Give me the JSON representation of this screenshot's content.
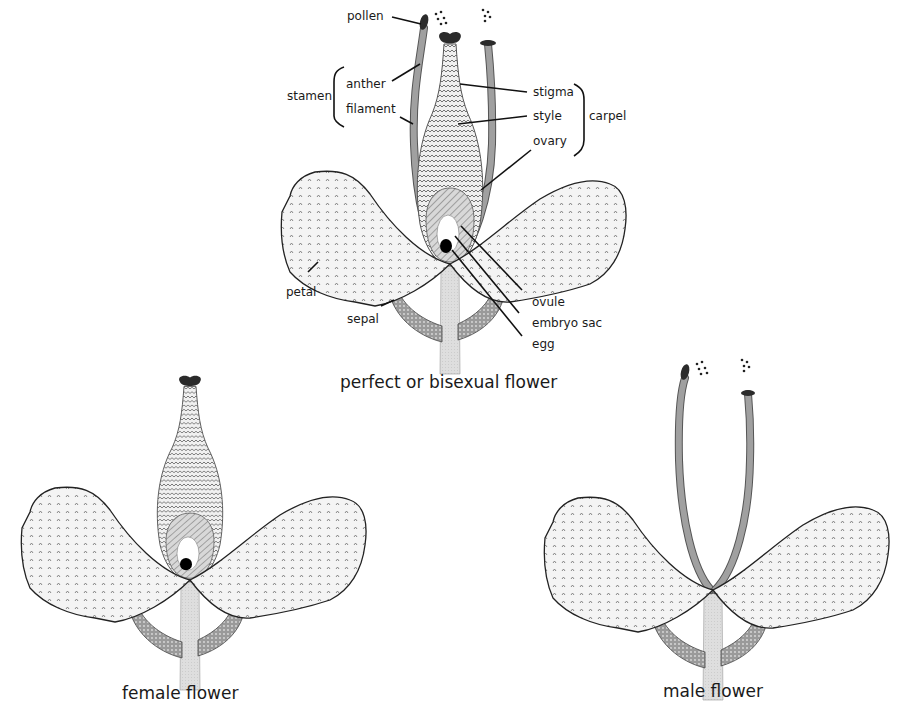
{
  "diagram": {
    "type": "flower anatomy illustration",
    "colors": {
      "petal_fill": "#f2f2f2",
      "pattern_ink": "#777777",
      "filament": "#9a9a9a",
      "stem": "#dcdcdc",
      "sepal": "#8a8a8a",
      "anther_stigma": "#2b2b2b",
      "egg": "#000000",
      "embryo_sac": "#ffffff"
    },
    "flowers": [
      {
        "id": "perfect",
        "caption": "perfect or bisexual flower",
        "labels": {
          "pollen": "pollen",
          "anther": "anther",
          "filament": "filament",
          "stamen": "stamen",
          "stigma": "stigma",
          "style": "style",
          "ovary": "ovary",
          "carpel": "carpel",
          "petal": "petal",
          "sepal": "sepal",
          "ovule": "ovule",
          "embryo_sac": "embryo sac",
          "egg": "egg"
        }
      },
      {
        "id": "female",
        "caption": "female flower"
      },
      {
        "id": "male",
        "caption": "male flower"
      }
    ]
  }
}
